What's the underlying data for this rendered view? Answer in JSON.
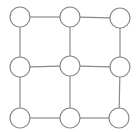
{
  "diagram": {
    "type": "grid-graph",
    "rows": 3,
    "cols": 3,
    "node_radius": 10,
    "stroke_color": "#8a8a8a",
    "fill_color": "#ffffff",
    "nodes": [
      {
        "id": "n00",
        "x": 20,
        "y": 17
      },
      {
        "id": "n01",
        "x": 70,
        "y": 17
      },
      {
        "id": "n02",
        "x": 120,
        "y": 18
      },
      {
        "id": "n10",
        "x": 20,
        "y": 67
      },
      {
        "id": "n11",
        "x": 70,
        "y": 66
      },
      {
        "id": "n12",
        "x": 120,
        "y": 67
      },
      {
        "id": "n20",
        "x": 20,
        "y": 118
      },
      {
        "id": "n21",
        "x": 70,
        "y": 118
      },
      {
        "id": "n22",
        "x": 119,
        "y": 118
      }
    ],
    "edges": [
      [
        "n00",
        "n01"
      ],
      [
        "n01",
        "n02"
      ],
      [
        "n10",
        "n11"
      ],
      [
        "n11",
        "n12"
      ],
      [
        "n20",
        "n21"
      ],
      [
        "n21",
        "n22"
      ],
      [
        "n00",
        "n10"
      ],
      [
        "n10",
        "n20"
      ],
      [
        "n01",
        "n11"
      ],
      [
        "n11",
        "n21"
      ],
      [
        "n02",
        "n12"
      ],
      [
        "n12",
        "n22"
      ]
    ]
  }
}
